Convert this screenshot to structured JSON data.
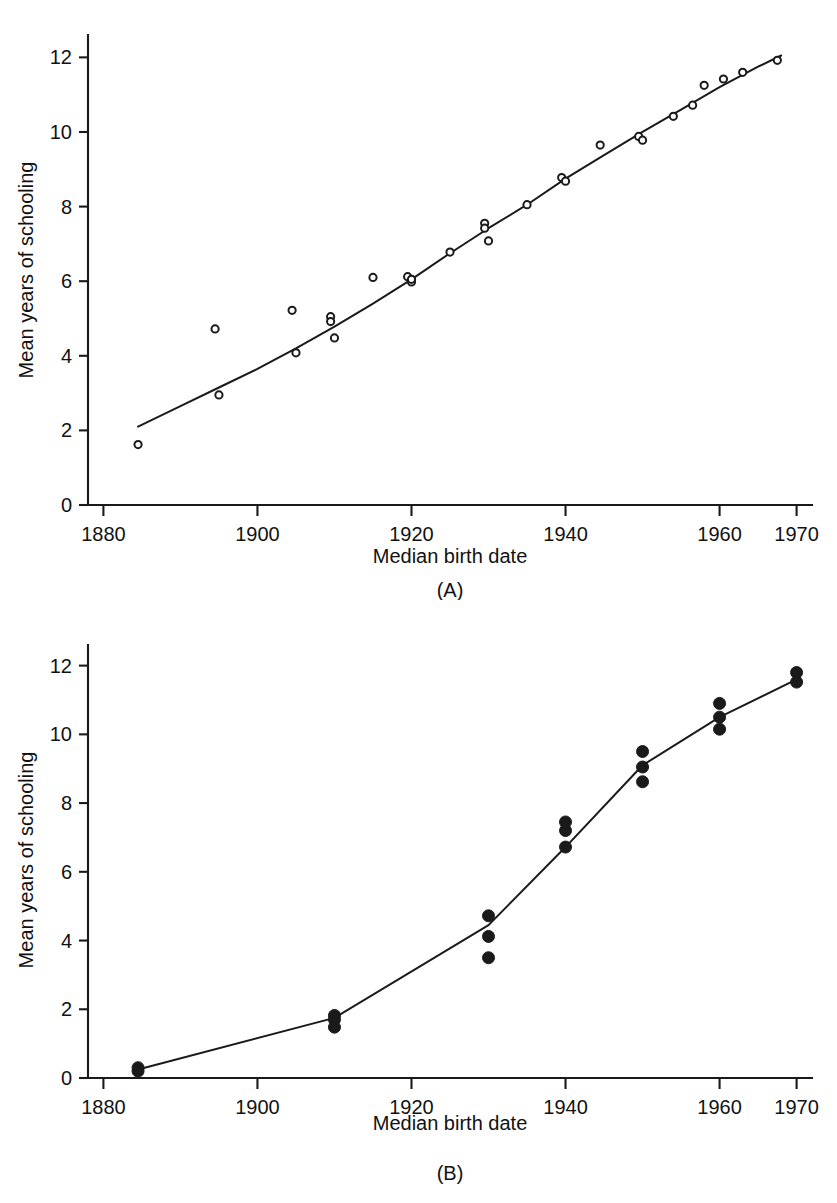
{
  "figure": {
    "panel_a_caption": "(A)",
    "panel_b_caption": "(B)"
  },
  "chart_data": [
    {
      "id": "panel-a",
      "type": "scatter",
      "title": "",
      "caption": "(A)",
      "xlabel": "Median birth date",
      "ylabel": "Mean years of schooling",
      "xlim": [
        1878,
        1972
      ],
      "ylim": [
        0,
        12.6
      ],
      "xticks": [
        1880,
        1900,
        1920,
        1940,
        1960,
        1970
      ],
      "xticklabels": [
        "1880",
        "1900",
        "1920",
        "1940",
        "1960",
        "1970"
      ],
      "yticks": [
        0,
        2,
        4,
        6,
        8,
        10,
        12
      ],
      "yticklabels": [
        "0",
        "2",
        "4",
        "6",
        "8",
        "10",
        "12"
      ],
      "grid": false,
      "legend": "none",
      "marker_style": "open-circle",
      "series": [
        {
          "name": "Mean years of schooling by median birth date",
          "points": [
            [
              1884.5,
              1.62
            ],
            [
              1894.5,
              4.72
            ],
            [
              1895.0,
              2.95
            ],
            [
              1904.5,
              5.22
            ],
            [
              1905.0,
              4.08
            ],
            [
              1909.5,
              5.05
            ],
            [
              1909.5,
              4.92
            ],
            [
              1910.0,
              4.48
            ],
            [
              1915.0,
              6.1
            ],
            [
              1919.5,
              6.12
            ],
            [
              1920.0,
              5.98
            ],
            [
              1920.0,
              6.05
            ],
            [
              1925.0,
              6.78
            ],
            [
              1929.5,
              7.55
            ],
            [
              1929.5,
              7.42
            ],
            [
              1930.0,
              7.08
            ],
            [
              1935.0,
              8.05
            ],
            [
              1939.5,
              8.78
            ],
            [
              1940.0,
              8.68
            ],
            [
              1944.5,
              9.65
            ],
            [
              1949.5,
              9.88
            ],
            [
              1950.0,
              9.78
            ],
            [
              1954.0,
              10.42
            ],
            [
              1956.5,
              10.72
            ],
            [
              1958.0,
              11.25
            ],
            [
              1960.5,
              11.42
            ],
            [
              1963.0,
              11.6
            ],
            [
              1967.5,
              11.92
            ]
          ]
        }
      ],
      "trend": {
        "name": "smoothed trend",
        "points": [
          [
            1884.5,
            2.1
          ],
          [
            1890.0,
            2.65
          ],
          [
            1895.0,
            3.15
          ],
          [
            1900.0,
            3.65
          ],
          [
            1905.0,
            4.2
          ],
          [
            1910.0,
            4.78
          ],
          [
            1915.0,
            5.4
          ],
          [
            1920.0,
            6.05
          ],
          [
            1925.0,
            6.75
          ],
          [
            1930.0,
            7.42
          ],
          [
            1935.0,
            8.05
          ],
          [
            1940.0,
            8.75
          ],
          [
            1945.0,
            9.38
          ],
          [
            1950.0,
            10.0
          ],
          [
            1955.0,
            10.6
          ],
          [
            1960.0,
            11.2
          ],
          [
            1965.0,
            11.75
          ],
          [
            1968.0,
            12.05
          ]
        ]
      }
    },
    {
      "id": "panel-b",
      "type": "scatter",
      "title": "",
      "caption": "(B)",
      "xlabel": "Median birth date",
      "ylabel": "Mean years of schooling",
      "xlim": [
        1878,
        1972
      ],
      "ylim": [
        0,
        12.6
      ],
      "xticks": [
        1880,
        1900,
        1920,
        1940,
        1960,
        1970
      ],
      "xticklabels": [
        "1880",
        "1900",
        "1920",
        "1940",
        "1960",
        "1970"
      ],
      "yticks": [
        0,
        2,
        4,
        6,
        8,
        10,
        12
      ],
      "yticklabels": [
        "0",
        "2",
        "4",
        "6",
        "8",
        "10",
        "12"
      ],
      "grid": false,
      "legend": "none",
      "marker_style": "filled-circle",
      "series": [
        {
          "name": "Mean years of schooling by median birth date",
          "points": [
            [
              1884.5,
              0.3
            ],
            [
              1884.5,
              0.2
            ],
            [
              1910.0,
              1.82
            ],
            [
              1910.0,
              1.7
            ],
            [
              1910.0,
              1.48
            ],
            [
              1930.0,
              4.72
            ],
            [
              1930.0,
              4.12
            ],
            [
              1930.0,
              3.5
            ],
            [
              1940.0,
              7.45
            ],
            [
              1940.0,
              7.2
            ],
            [
              1940.0,
              6.72
            ],
            [
              1950.0,
              9.5
            ],
            [
              1950.0,
              9.05
            ],
            [
              1950.0,
              8.62
            ],
            [
              1960.0,
              10.9
            ],
            [
              1960.0,
              10.5
            ],
            [
              1960.0,
              10.15
            ],
            [
              1970.0,
              11.8
            ],
            [
              1970.0,
              11.52
            ]
          ]
        }
      ],
      "trend": {
        "name": "connecting line",
        "points": [
          [
            1884.5,
            0.25
          ],
          [
            1910.0,
            1.75
          ],
          [
            1930.0,
            4.45
          ],
          [
            1940.0,
            6.72
          ],
          [
            1950.0,
            9.1
          ],
          [
            1960.0,
            10.5
          ],
          [
            1970.0,
            11.6
          ]
        ]
      }
    }
  ]
}
